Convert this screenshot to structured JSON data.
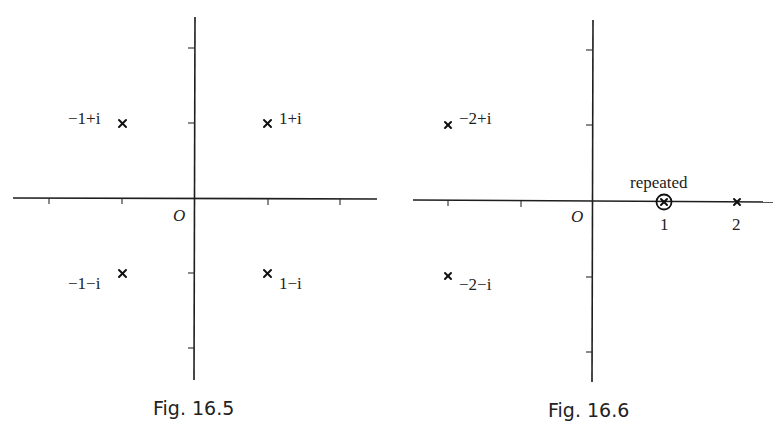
{
  "figures": [
    {
      "caption": "Fig. 16.5",
      "origin_label": "O",
      "points": [
        {
          "label": "−1+i",
          "re": -1,
          "im": 1
        },
        {
          "label": "1+i",
          "re": 1,
          "im": 1
        },
        {
          "label": "−1−i",
          "re": -1,
          "im": -1
        },
        {
          "label": "1−i",
          "re": 1,
          "im": -1
        }
      ]
    },
    {
      "caption": "Fig. 16.6",
      "origin_label": "O",
      "annotation": "repeated",
      "tick_labels": [
        "1",
        "2"
      ],
      "points": [
        {
          "label": "−2+i",
          "re": -2,
          "im": 1
        },
        {
          "label": "−2−i",
          "re": -2,
          "im": -1
        },
        {
          "label": "1",
          "re": 1,
          "im": 0,
          "repeated": true
        },
        {
          "label": "2",
          "re": 2,
          "im": 0
        }
      ]
    }
  ],
  "colors": {
    "ink": "#1e1e1e",
    "background": "#ffffff"
  }
}
